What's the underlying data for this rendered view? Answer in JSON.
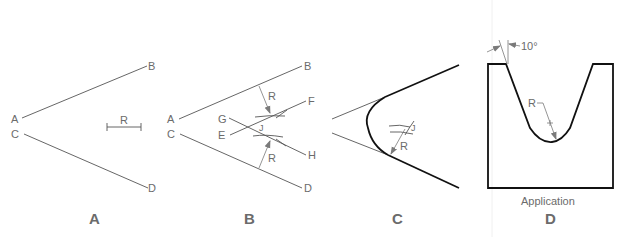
{
  "panels": {
    "a": {
      "caption": "A",
      "labels": {
        "a": "A",
        "b": "B",
        "c": "C",
        "d": "D",
        "r": "R"
      }
    },
    "b": {
      "caption": "B",
      "labels": {
        "a": "A",
        "b": "B",
        "c": "C",
        "d": "D",
        "e": "E",
        "f": "F",
        "g": "G",
        "h": "H",
        "j": "J",
        "r_top": "R",
        "r_bottom": "R"
      }
    },
    "c": {
      "caption": "C",
      "labels": {
        "j": "J",
        "r": "R"
      }
    },
    "d": {
      "caption": "D",
      "subtitle": "Application",
      "labels": {
        "angle": "10°",
        "r": "R"
      }
    }
  },
  "colors": {
    "label": "#6b6b6b",
    "construction_line": "#555555",
    "final_line": "#111111",
    "arrow": "#7a7a7a"
  }
}
